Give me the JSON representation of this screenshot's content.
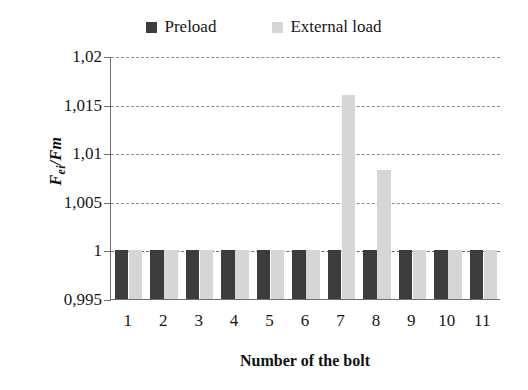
{
  "chart_data": {
    "type": "bar",
    "title": "",
    "xlabel": "Number of the bolt",
    "ylabel": "Fei/Fm",
    "categories": [
      "1",
      "2",
      "3",
      "4",
      "5",
      "6",
      "7",
      "8",
      "9",
      "10",
      "11"
    ],
    "series": [
      {
        "name": "Preload",
        "color": "#3c3c3c",
        "values": [
          1,
          1,
          1,
          1,
          1,
          1,
          1,
          1,
          1,
          1,
          1
        ]
      },
      {
        "name": "External load",
        "color": "#d6d6d6",
        "values": [
          1,
          1,
          1,
          1,
          1,
          1,
          1.016,
          1.0083,
          1,
          1,
          1
        ]
      }
    ],
    "ylim": [
      0.995,
      1.02
    ],
    "ytick_labels": [
      "1,02",
      "1,015",
      "1,01",
      "1,005",
      "1",
      "0,995"
    ],
    "ytick_values": [
      1.02,
      1.015,
      1.01,
      1.005,
      1,
      0.995
    ],
    "grid": true,
    "legend_position": "top"
  },
  "legend": {
    "entries": [
      {
        "label": "Preload",
        "color": "#3c3c3c"
      },
      {
        "label": "External load",
        "color": "#d6d6d6"
      }
    ]
  },
  "axes": {
    "y_title": "Fei/Fm",
    "y_title_parts": {
      "main": "F",
      "sub": "ei",
      "denom": "/Fm"
    },
    "x_title": "Number of the bolt"
  }
}
